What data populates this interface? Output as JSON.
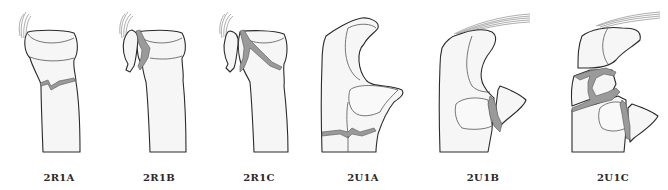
{
  "colors": {
    "background": "#ffffff",
    "bone_fill": "#f6f6f6",
    "outline": "#2b2b2b",
    "fracture_fill": "#9a9a9a",
    "label_text": "#2a2a2a"
  },
  "figures": [
    {
      "id": "2R1A",
      "label": "2R1A",
      "bone": "radius",
      "description": "Extra-articular fracture of radial neck (transverse)"
    },
    {
      "id": "2R1B",
      "label": "2R1B",
      "bone": "radius",
      "description": "Partial articular fracture of radial head"
    },
    {
      "id": "2R1C",
      "label": "2R1C",
      "bone": "radius",
      "description": "Complete articular fracture of radial head"
    },
    {
      "id": "2U1A",
      "label": "2U1A",
      "bone": "ulna",
      "description": "Extra-articular metaphyseal fracture of proximal ulna"
    },
    {
      "id": "2U1B",
      "label": "2U1B",
      "bone": "ulna",
      "description": "Partial articular fracture of coronoid process"
    },
    {
      "id": "2U1C",
      "label": "2U1C",
      "bone": "ulna",
      "description": "Complete articular fracture of olecranon and coronoid"
    }
  ]
}
